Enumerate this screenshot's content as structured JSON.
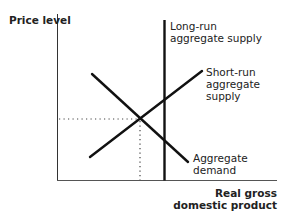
{
  "diagram": {
    "type": "economics-ad-as",
    "y_axis_label": "Price level",
    "x_axis_label_line1": "Real gross",
    "x_axis_label_line2": "domestic product",
    "curves": {
      "lras": {
        "line1": "Long-run",
        "line2": "aggregate supply"
      },
      "sras": {
        "line1": "Short-run",
        "line2": "aggregate",
        "line3": "supply"
      },
      "ad": {
        "line1": "Aggregate",
        "line2": "demand"
      }
    },
    "colors": {
      "line": "#111111",
      "axis": "#333333",
      "dotted": "#444444"
    }
  }
}
